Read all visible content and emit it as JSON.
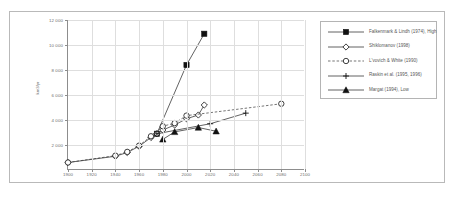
{
  "figure": {
    "top_caption": "",
    "bottom_caption": ""
  },
  "chart_data": {
    "type": "line",
    "title": "",
    "xlabel": "",
    "ylabel": "km3/yr",
    "xlim": [
      1900,
      2100
    ],
    "ylim": [
      0,
      12000
    ],
    "xticks": [
      "1900",
      "1920",
      "1940",
      "1960",
      "1980",
      "2000",
      "2020",
      "2040",
      "2060",
      "2080",
      "2100"
    ],
    "yticks": [
      "2 000",
      "4 000",
      "6 000",
      "8 000",
      "10 000",
      "12 000"
    ],
    "grid": true,
    "legend_position": "right",
    "series": [
      {
        "name": "Falkenmark & Lindh (1974), High",
        "marker": "filled-square",
        "line": "solid",
        "points": [
          [
            1975,
            2900
          ],
          [
            2000,
            8400
          ],
          [
            2015,
            10900
          ]
        ]
      },
      {
        "name": "Shiklomanov (1998)",
        "marker": "open-diamond",
        "line": "solid",
        "points": [
          [
            1900,
            600
          ],
          [
            1940,
            1100
          ],
          [
            1950,
            1400
          ],
          [
            1960,
            1900
          ],
          [
            1970,
            2600
          ],
          [
            1975,
            2900
          ],
          [
            1980,
            3200
          ],
          [
            1990,
            3600
          ],
          [
            2000,
            4100
          ],
          [
            2010,
            4400
          ],
          [
            2015,
            5200
          ]
        ]
      },
      {
        "name": "L'vovich & White (1990)",
        "marker": "open-circle",
        "line": "dashed",
        "points": [
          [
            1900,
            600
          ],
          [
            1940,
            1150
          ],
          [
            1950,
            1450
          ],
          [
            1960,
            1950
          ],
          [
            1970,
            2700
          ],
          [
            1980,
            3500
          ],
          [
            1990,
            3750
          ],
          [
            2000,
            4350
          ],
          [
            2080,
            5300
          ]
        ]
      },
      {
        "name": "Raskin et al. (1995, 1996)",
        "marker": "plus",
        "line": "solid",
        "points": [
          [
            1975,
            2900
          ],
          [
            2020,
            3700
          ],
          [
            2050,
            4550
          ]
        ]
      },
      {
        "name": "Margat (1994), Low",
        "marker": "filled-triangle",
        "line": "solid",
        "points": [
          [
            1980,
            2450
          ],
          [
            1990,
            3050
          ],
          [
            2010,
            3400
          ],
          [
            2025,
            3100
          ]
        ]
      }
    ]
  }
}
